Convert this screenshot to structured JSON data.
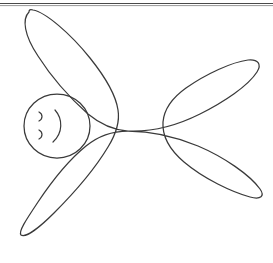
{
  "page": {
    "background_color": "#ffffff",
    "width": 273,
    "height": 263,
    "ink_color": "#3a3a3a",
    "rule_color": "#4a4a4a"
  },
  "header_rule": {
    "name": "top page rule",
    "y_primary": 3.5,
    "y_secondary": 5.5,
    "x_start": 0,
    "x_end": 273,
    "color": "#4a4a4a"
  },
  "figure": {
    "name": "four-limbed figure",
    "stroke_color": "#3a3a3a",
    "stroke_width": 1.25,
    "filled": false,
    "body_center": [
      128,
      130
    ],
    "limbs": [
      {
        "name": "upper-left-arm",
        "tip": [
          29,
          12
        ],
        "direction": "up-left"
      },
      {
        "name": "upper-right-arm",
        "tip": [
          258,
          68
        ],
        "direction": "up-right"
      },
      {
        "name": "lower-right-arm",
        "tip": [
          262,
          196
        ],
        "direction": "right"
      },
      {
        "name": "lower-left-arm",
        "tip": [
          20,
          232
        ],
        "direction": "down-left"
      }
    ],
    "outline_path": "M 29 12 C 22 19, 24 35, 38 56 C 52 78, 70 98, 88 114 C 100 124, 112 130, 128 131 C 150 132, 176 126, 200 114 C 224 102, 248 86, 257 72 C 262 64, 258 59, 248 60 C 232 62, 206 74, 186 88 C 172 98, 164 110, 163 122 C 162 136, 170 150, 184 162 C 204 179, 232 192, 250 197 C 261 200, 265 196, 260 189 C 250 175, 224 157, 198 146 C 172 135, 148 131, 128 131 C 112 131, 98 136, 86 146 C 70 159, 52 181, 38 202 C 26 220, 18 232, 21 235 C 25 238, 38 229, 54 213 C 74 193, 96 167, 108 147 C 116 134, 120 122, 118 110 C 116 96, 106 78, 90 58 C 70 33, 45 12, 33 10 C 30 9, 29 10, 29 12 Z",
    "head": {
      "name": "head",
      "center": [
        57,
        126
      ],
      "radius_x": 33,
      "radius_y": 32,
      "path": "M 90 126 C 90 144, 75 158, 57 158 C 39 158, 24 144, 24 126 C 24 108, 39 94, 57 94 C 75 94, 90 108, 90 126 Z"
    },
    "face": {
      "name": "smiley face",
      "features": [
        {
          "name": "eye",
          "path": "M 39 112 C 43 114, 43 119, 39 121"
        },
        {
          "name": "nose",
          "path": "M 39 130 C 43 132, 43 137, 39 139"
        },
        {
          "name": "mouth",
          "path": "M 55 110 C 63 119, 63 133, 53 142"
        }
      ]
    }
  }
}
